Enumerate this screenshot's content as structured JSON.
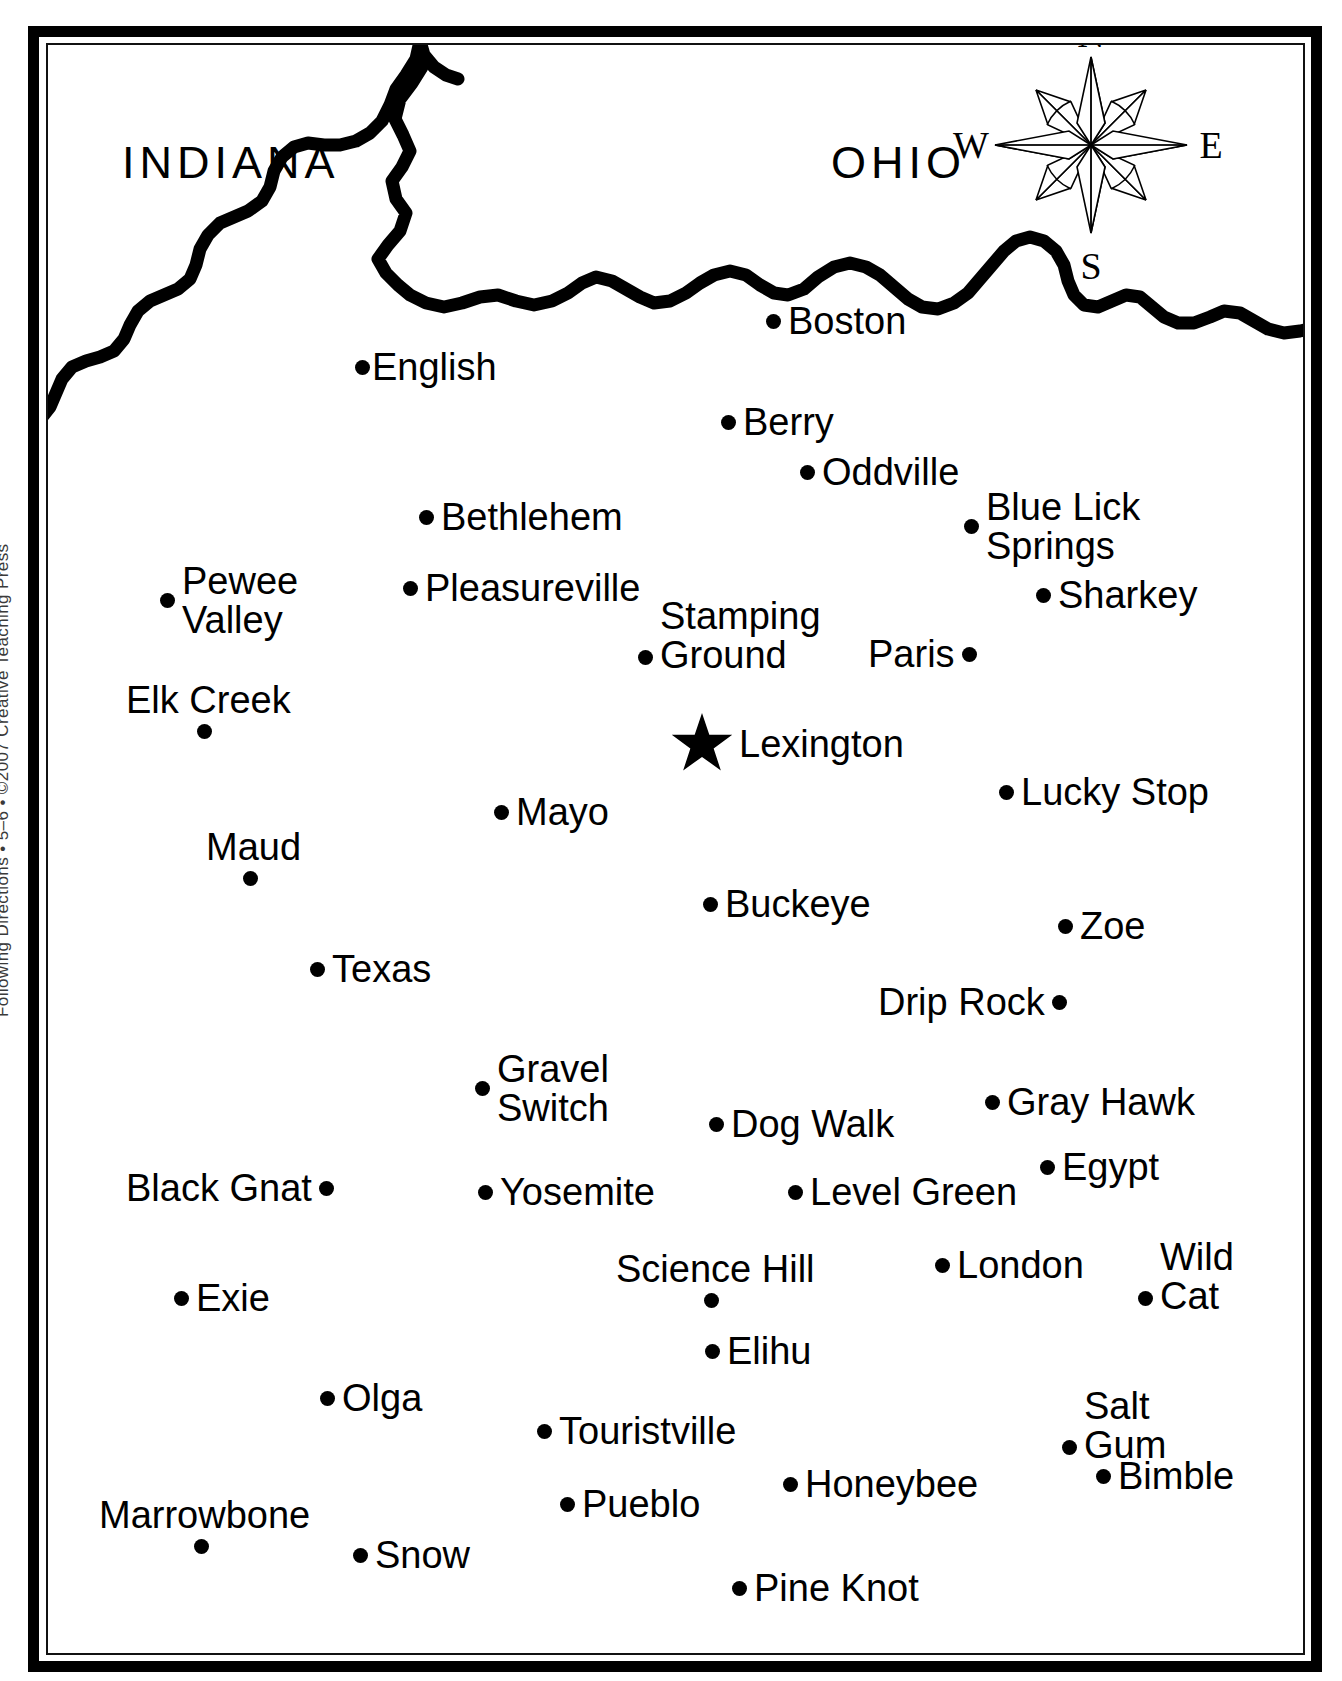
{
  "margin_credit": "Following Directions  •  5–6  •  ©2007 Creative Teaching Press",
  "colors": {
    "ink": "#000000",
    "paper": "#ffffff"
  },
  "states": [
    {
      "name": "INDIANA",
      "x": 74,
      "y": 92
    },
    {
      "name": "OHIO",
      "x": 783,
      "y": 92
    }
  ],
  "compass": {
    "north": "N",
    "south": "S",
    "east": "E",
    "west": "W"
  },
  "capital": {
    "name": "Lexington",
    "x": 623,
    "y": 668,
    "marker": "star"
  },
  "cities": [
    {
      "name": "Boston",
      "x": 718,
      "y": 257,
      "dot": "left"
    },
    {
      "name": "English",
      "x": 307,
      "y": 303,
      "dot": "left",
      "tight": true
    },
    {
      "name": "Berry",
      "x": 673,
      "y": 358,
      "dot": "left"
    },
    {
      "name": "Oddville",
      "x": 752,
      "y": 408,
      "dot": "left"
    },
    {
      "name": "Bethlehem",
      "x": 371,
      "y": 453,
      "dot": "left"
    },
    {
      "name": "Blue Lick\nSprings",
      "x": 916,
      "y": 443,
      "dot": "left",
      "lines": 2
    },
    {
      "name": "Pewee\nValley",
      "x": 112,
      "y": 517,
      "dot": "left",
      "lines": 2
    },
    {
      "name": "Pleasureville",
      "x": 355,
      "y": 524,
      "dot": "left"
    },
    {
      "name": "Sharkey",
      "x": 988,
      "y": 531,
      "dot": "left"
    },
    {
      "name": "Stamping\nGround",
      "x": 590,
      "y": 552,
      "dot": "left",
      "lines": 2,
      "dot_line": 2
    },
    {
      "name": "Paris",
      "x": 820,
      "y": 590,
      "dot": "right"
    },
    {
      "name": "Elk Creek",
      "x": 78,
      "y": 636,
      "dot": "below"
    },
    {
      "name": "Lucky Stop",
      "x": 951,
      "y": 728,
      "dot": "left"
    },
    {
      "name": "Mayo",
      "x": 446,
      "y": 748,
      "dot": "left"
    },
    {
      "name": "Maud",
      "x": 158,
      "y": 783,
      "dot": "below"
    },
    {
      "name": "Buckeye",
      "x": 655,
      "y": 840,
      "dot": "left"
    },
    {
      "name": "Zoe",
      "x": 1010,
      "y": 862,
      "dot": "left"
    },
    {
      "name": "Texas",
      "x": 262,
      "y": 905,
      "dot": "left"
    },
    {
      "name": "Drip Rock",
      "x": 830,
      "y": 938,
      "dot": "right"
    },
    {
      "name": "Gravel\nSwitch",
      "x": 427,
      "y": 1005,
      "dot": "left",
      "lines": 2
    },
    {
      "name": "Gray Hawk",
      "x": 937,
      "y": 1038,
      "dot": "left"
    },
    {
      "name": "Dog Walk",
      "x": 661,
      "y": 1060,
      "dot": "left"
    },
    {
      "name": "Egypt",
      "x": 992,
      "y": 1103,
      "dot": "left"
    },
    {
      "name": "Black Gnat",
      "x": 78,
      "y": 1124,
      "dot": "right"
    },
    {
      "name": "Yosemite",
      "x": 430,
      "y": 1128,
      "dot": "left"
    },
    {
      "name": "Level Green",
      "x": 740,
      "y": 1128,
      "dot": "left"
    },
    {
      "name": "London",
      "x": 887,
      "y": 1201,
      "dot": "left"
    },
    {
      "name": "Wild\nCat",
      "x": 1090,
      "y": 1193,
      "dot": "left",
      "lines": 2,
      "dot_line": 2
    },
    {
      "name": "Exie",
      "x": 126,
      "y": 1234,
      "dot": "left"
    },
    {
      "name": "Science\nHill",
      "x": 568,
      "y": 1205,
      "dot": "below"
    },
    {
      "name": "Elihu",
      "x": 657,
      "y": 1287,
      "dot": "left"
    },
    {
      "name": "Salt\nGum",
      "x": 1014,
      "y": 1342,
      "dot": "left",
      "lines": 2,
      "dot_line": 2
    },
    {
      "name": "Olga",
      "x": 272,
      "y": 1334,
      "dot": "left"
    },
    {
      "name": "Touristville",
      "x": 489,
      "y": 1367,
      "dot": "left"
    },
    {
      "name": "Bimble",
      "x": 1048,
      "y": 1412,
      "dot": "left"
    },
    {
      "name": "Honeybee",
      "x": 735,
      "y": 1420,
      "dot": "left"
    },
    {
      "name": "Pueblo",
      "x": 512,
      "y": 1440,
      "dot": "left"
    },
    {
      "name": "Marrowbone",
      "x": 51,
      "y": 1451,
      "dot": "below"
    },
    {
      "name": "Snow",
      "x": 305,
      "y": 1491,
      "dot": "left"
    },
    {
      "name": "Pine Knot",
      "x": 684,
      "y": 1524,
      "dot": "left"
    }
  ]
}
